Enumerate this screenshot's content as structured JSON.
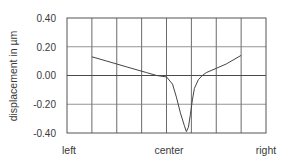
{
  "chart_data": {
    "type": "line",
    "title": "",
    "xlabel": "",
    "ylabel": "displacement in µm",
    "ylim": [
      -0.4,
      0.4
    ],
    "yticks": [
      "0.40",
      "0.20",
      "0.00",
      "-0.20",
      "-0.40"
    ],
    "xtick_labels": [
      "left",
      "center",
      "right"
    ],
    "grid": true,
    "grid_columns": 8,
    "grid_rows": 4,
    "legend": null,
    "series": [
      {
        "name": "displacement profile",
        "x": [
          0.125,
          0.2,
          0.3,
          0.4,
          0.45,
          0.5,
          0.53,
          0.55,
          0.57,
          0.59,
          0.6,
          0.61,
          0.62,
          0.63,
          0.64,
          0.66,
          0.68,
          0.7,
          0.75,
          0.8,
          0.875
        ],
        "values": [
          0.13,
          0.1,
          0.06,
          0.02,
          0.0,
          -0.01,
          -0.06,
          -0.15,
          -0.26,
          -0.35,
          -0.39,
          -0.36,
          -0.27,
          -0.17,
          -0.09,
          -0.03,
          0.0,
          0.02,
          0.05,
          0.08,
          0.14
        ]
      }
    ]
  }
}
